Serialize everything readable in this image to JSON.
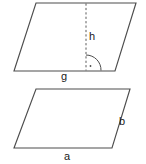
{
  "figure": {
    "background_color": "#ffffff",
    "stroke_color": "#4d4d4d",
    "label_color": "#1a1a1a",
    "shapes": [
      {
        "name": "upper-parallelogram",
        "vertices": "36,3 136,3 115,71 14,71",
        "labels": {
          "height": "h",
          "base": "g"
        },
        "markers": {
          "height_line": "dashed vertical segment from top edge to base",
          "right_angle": "quarter-arc with center dot at foot of height"
        }
      },
      {
        "name": "lower-parallelogram",
        "vertices": "36,89 130,89 112,148 14,148",
        "labels": {
          "side": "b",
          "base": "a"
        }
      }
    ]
  },
  "labels": {
    "h": "h",
    "g": "g",
    "b": "b",
    "a": "a"
  }
}
